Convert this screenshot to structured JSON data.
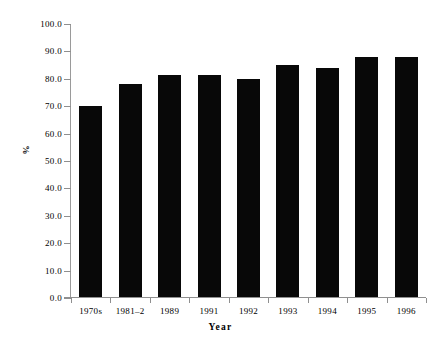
{
  "chart_data": {
    "type": "bar",
    "title": "",
    "subtitle": "",
    "xlabel": "Year",
    "ylabel": "%",
    "categories": [
      "1970s",
      "1981–2",
      "1989",
      "1991",
      "1992",
      "1993",
      "1994",
      "1995",
      "1996"
    ],
    "values": [
      70.0,
      78.0,
      81.5,
      81.5,
      80.0,
      85.0,
      84.0,
      88.0,
      88.0
    ],
    "ylim": [
      0.0,
      100.0
    ],
    "ytick_values": [
      0.0,
      10.0,
      20.0,
      30.0,
      40.0,
      50.0,
      60.0,
      70.0,
      80.0,
      90.0,
      100.0
    ],
    "ytick_labels": [
      "0.0",
      "10.0",
      "20.0",
      "30.0",
      "40.0",
      "50.0",
      "60.0",
      "70.0",
      "80.0",
      "90.0",
      "100.0"
    ],
    "grid": false,
    "legend": null,
    "legend_position": "none",
    "bar_color": "#080808",
    "axis_color": "#8f8f8f",
    "background_color": "#ffffff",
    "annotations": []
  }
}
